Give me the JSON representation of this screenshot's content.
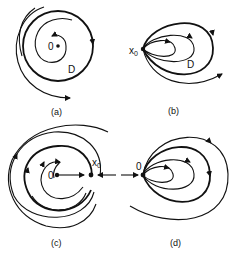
{
  "figure": {
    "panels": [
      {
        "id": "a",
        "caption": "(a)",
        "point_label": "0",
        "region_label": "D"
      },
      {
        "id": "b",
        "caption": "(b)",
        "point_label": "x",
        "point_subscript": "0",
        "region_label": "D"
      },
      {
        "id": "c",
        "caption": "(c)",
        "origin_label": "0",
        "point_label": "x",
        "point_subscript": "0"
      },
      {
        "id": "d",
        "caption": "(d)",
        "point_label": "0"
      }
    ],
    "colors": {
      "ink": "#111111",
      "background": "#ffffff"
    }
  }
}
